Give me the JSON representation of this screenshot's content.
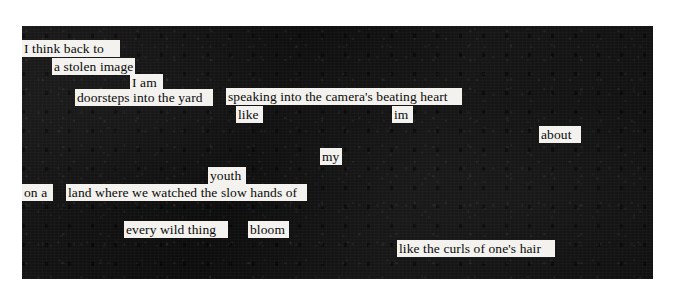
{
  "artwork": {
    "type": "blackout-poetry",
    "background_color": "#ffffff",
    "panel_color": "#121212",
    "highlight_color": "#f3f2ee",
    "text_color": "#0a0a0a",
    "full_text": "I think back to a stolen image I am doorsteps into the yard speaking into the camera's beating heart like im about my youth on a land where we watched the slow hands of every wild thing bloom like the curls of one's hair"
  },
  "lines": [
    {
      "text": "I think back to",
      "x": 22,
      "y": 40,
      "width": 98
    },
    {
      "text": "a stolen image",
      "x": 52,
      "y": 58,
      "width": 83
    },
    {
      "text": "I am",
      "x": 130,
      "y": 74,
      "width": 33
    },
    {
      "text": "doorsteps into the yard",
      "x": 75,
      "y": 89,
      "width": 138
    },
    {
      "text": "speaking into the camera's beating heart",
      "x": 226,
      "y": 88,
      "width": 236
    },
    {
      "text": "like",
      "x": 236,
      "y": 106,
      "width": 27
    },
    {
      "text": "im",
      "x": 392,
      "y": 106,
      "width": 21
    },
    {
      "text": "about",
      "x": 539,
      "y": 126,
      "width": 42
    },
    {
      "text": "my",
      "x": 320,
      "y": 148,
      "width": 22
    },
    {
      "text": "youth",
      "x": 208,
      "y": 167,
      "width": 38
    },
    {
      "text": "on a",
      "x": 22,
      "y": 184,
      "width": 31
    },
    {
      "text": "land where we watched the slow hands of",
      "x": 66,
      "y": 184,
      "width": 241
    },
    {
      "text": "every wild thing",
      "x": 124,
      "y": 221,
      "width": 104
    },
    {
      "text": "bloom",
      "x": 248,
      "y": 221,
      "width": 41
    },
    {
      "text": "like the curls of one's hair",
      "x": 397,
      "y": 240,
      "width": 158
    }
  ]
}
